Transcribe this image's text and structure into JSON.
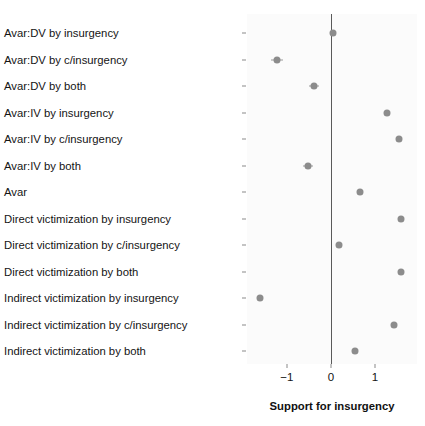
{
  "chart_data": {
    "type": "scatter",
    "title": "",
    "subtitle": "",
    "xlabel": "Support for insurgency",
    "ylabel": "",
    "xlim": [
      -1.9,
      1.95
    ],
    "ylim": [
      0,
      14
    ],
    "grid": false,
    "legend": null,
    "legend_position": "none",
    "zero_reference_line": 0,
    "orientation": "horizontal",
    "xticks": [
      -1,
      0,
      1
    ],
    "xticklabels": [
      "−1",
      "0",
      "1"
    ],
    "categories": [
      "Avar:DV by insurgency",
      "Avar:DV by c/insurgency",
      "Avar:DV by both",
      "Avar:IV by insurgency",
      "Avar:IV by c/insurgency",
      "Avar:IV by both",
      "Avar",
      "Direct victimization by insurgency",
      "Direct victimization by c/insurgency",
      "Direct victimization by both",
      "Indirect victimization by insurgency",
      "Indirect victimization by c/insurgency",
      "Indirect victimization by both"
    ],
    "values": [
      0.05,
      -1.22,
      -0.38,
      1.27,
      1.55,
      -0.52,
      0.67,
      1.59,
      0.18,
      1.59,
      -1.6,
      1.44,
      0.55
    ],
    "points": [
      {
        "label": "Avar:DV by insurgency",
        "estimate": 0.05,
        "ci_low": -0.02,
        "ci_high": 0.12
      },
      {
        "label": "Avar:DV by c/insurgency",
        "estimate": -1.22,
        "ci_low": -1.36,
        "ci_high": -1.08
      },
      {
        "label": "Avar:DV by both",
        "estimate": -0.38,
        "ci_low": -0.49,
        "ci_high": -0.27
      },
      {
        "label": "Avar:IV by insurgency",
        "estimate": 1.27,
        "ci_low": 1.22,
        "ci_high": 1.32
      },
      {
        "label": "Avar:IV by c/insurgency",
        "estimate": 1.55,
        "ci_low": 1.5,
        "ci_high": 1.6
      },
      {
        "label": "Avar:IV by both",
        "estimate": -0.52,
        "ci_low": -0.63,
        "ci_high": -0.41
      },
      {
        "label": "Avar",
        "estimate": 0.67,
        "ci_low": 0.62,
        "ci_high": 0.72
      },
      {
        "label": "Direct victimization by insurgency",
        "estimate": 1.59,
        "ci_low": 1.54,
        "ci_high": 1.64
      },
      {
        "label": "Direct victimization by c/insurgency",
        "estimate": 0.18,
        "ci_low": 0.11,
        "ci_high": 0.25
      },
      {
        "label": "Direct victimization by both",
        "estimate": 1.59,
        "ci_low": 1.54,
        "ci_high": 1.64
      },
      {
        "label": "Indirect victimization by insurgency",
        "estimate": -1.6,
        "ci_low": -1.66,
        "ci_high": -1.54
      },
      {
        "label": "Indirect victimization by c/insurgency",
        "estimate": 1.44,
        "ci_low": 1.4,
        "ci_high": 1.48
      },
      {
        "label": "Indirect victimization by both",
        "estimate": 0.55,
        "ci_low": 0.5,
        "ci_high": 0.6
      }
    ],
    "colors": {
      "point": "#8c8c8c",
      "zero_line": "#5a5a5a",
      "panel_background": "#fbfbfb",
      "text": "#141414"
    }
  }
}
